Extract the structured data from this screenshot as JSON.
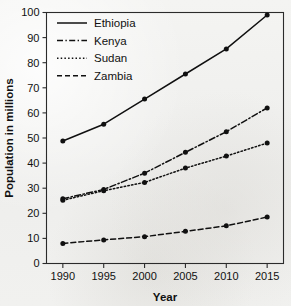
{
  "chart_data": {
    "type": "line",
    "title": "",
    "xlabel": "Year",
    "ylabel": "Population in millions",
    "x": [
      1990,
      1995,
      2000,
      2005,
      2010,
      2015
    ],
    "xtick_labels": [
      "1990",
      "1995",
      "2000",
      "2005",
      "2010",
      "2015"
    ],
    "xlim": [
      1988,
      2017
    ],
    "ylim": [
      0,
      100
    ],
    "ytick_labels": [
      "0",
      "10",
      "20",
      "30",
      "40",
      "50",
      "60",
      "70",
      "80",
      "90",
      "100"
    ],
    "yticks": [
      0,
      10,
      20,
      30,
      40,
      50,
      60,
      70,
      80,
      90,
      100
    ],
    "grid": false,
    "legend_position": "top-left inside",
    "marker": "filled-circle",
    "series": [
      {
        "name": "Ethiopia",
        "line_style": "solid",
        "color": "#101010",
        "values": [
          48.8,
          55.5,
          65.5,
          75.5,
          85.5,
          99.0
        ]
      },
      {
        "name": "Kenya",
        "line_style": "dash-dot",
        "color": "#101010",
        "values": [
          25.8,
          29.5,
          36.0,
          44.3,
          52.5,
          62.0
        ]
      },
      {
        "name": "Sudan",
        "line_style": "dotted",
        "color": "#101010",
        "values": [
          25.2,
          29.0,
          32.3,
          38.0,
          42.8,
          48.0
        ]
      },
      {
        "name": "Zambia",
        "line_style": "dashed",
        "color": "#101010",
        "values": [
          8.0,
          9.4,
          10.7,
          12.8,
          15.0,
          18.5
        ]
      }
    ]
  }
}
